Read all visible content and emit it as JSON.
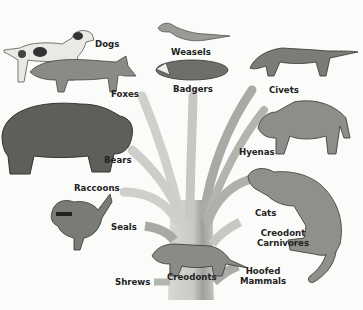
{
  "diagram": {
    "type": "evolutionary-tree",
    "root": "Creodonts",
    "colors": {
      "background": "#fbfbfa",
      "trunk_light": "#d3d3d0",
      "trunk_dark": "#9d9d99",
      "label": "#222222"
    },
    "labels": {
      "dogs": "Dogs",
      "foxes": "Foxes",
      "weasels": "Weasels",
      "badgers": "Badgers",
      "civets": "Civets",
      "bears": "Bears",
      "hyenas": "Hyenas",
      "raccoons": "Raccoons",
      "seals": "Seals",
      "cats": "Cats",
      "creodont_carnivores_line1": "Creodont",
      "creodont_carnivores_line2": "Carnivores",
      "shrews": "Shrews",
      "creodonts": "Creodonts",
      "hoofed_mammals_line1": "Hoofed",
      "hoofed_mammals_line2": "Mammals"
    },
    "branches": [
      {
        "name": "Foxes",
        "side": "left"
      },
      {
        "name": "Dogs",
        "side": "left"
      },
      {
        "name": "Bears",
        "side": "left"
      },
      {
        "name": "Raccoons",
        "side": "left"
      },
      {
        "name": "Seals",
        "side": "left"
      },
      {
        "name": "Shrews",
        "side": "left"
      },
      {
        "name": "Badgers",
        "side": "center"
      },
      {
        "name": "Weasels",
        "side": "center"
      },
      {
        "name": "Civets",
        "side": "right"
      },
      {
        "name": "Hyenas",
        "side": "right"
      },
      {
        "name": "Cats",
        "side": "right"
      },
      {
        "name": "Creodont Carnivores",
        "side": "right"
      },
      {
        "name": "Hoofed Mammals",
        "side": "right"
      }
    ]
  }
}
